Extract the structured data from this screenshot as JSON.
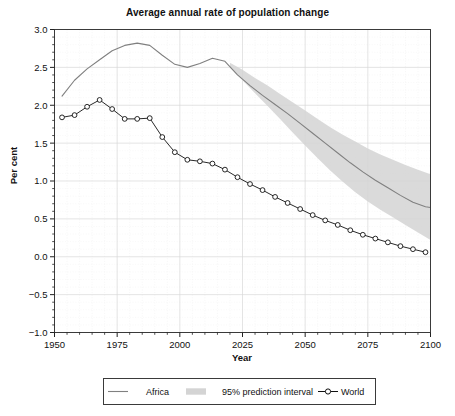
{
  "chart_data": {
    "type": "line",
    "title": "Average annual rate of population change",
    "xlabel": "Year",
    "ylabel": "Per cent",
    "xlim": [
      1950,
      2100
    ],
    "ylim": [
      -1.0,
      3.0
    ],
    "grid": true,
    "legend_position": "below",
    "xticks": [
      "1950",
      "1975",
      "2000",
      "2025",
      "2050",
      "2075",
      "2100"
    ],
    "xtick_values": [
      1950,
      1975,
      2000,
      2025,
      2050,
      2075,
      2100
    ],
    "yticks": [
      "3.0",
      "2.5",
      "2.0",
      "1.5",
      "1.0",
      "0.5",
      "0.0",
      "-0.5",
      "-1.0"
    ],
    "ytick_values": [
      3.0,
      2.5,
      2.0,
      1.5,
      1.0,
      0.5,
      0.0,
      -0.5,
      -1.0
    ],
    "series": [
      {
        "name": "Africa",
        "style": "line",
        "color": "#808080",
        "x": [
          1953,
          1958,
          1963,
          1968,
          1973,
          1978,
          1983,
          1988,
          1993,
          1998,
          2003,
          2008,
          2013,
          2018,
          2023,
          2028,
          2033,
          2038,
          2043,
          2048,
          2053,
          2058,
          2063,
          2068,
          2073,
          2078,
          2083,
          2088,
          2093,
          2098,
          2100
        ],
        "values": [
          2.12,
          2.33,
          2.48,
          2.6,
          2.72,
          2.79,
          2.82,
          2.79,
          2.66,
          2.54,
          2.5,
          2.55,
          2.62,
          2.58,
          2.4,
          2.26,
          2.13,
          2.01,
          1.89,
          1.76,
          1.63,
          1.5,
          1.37,
          1.24,
          1.12,
          1.01,
          0.91,
          0.81,
          0.72,
          0.66,
          0.65
        ]
      },
      {
        "name": "World",
        "style": "line-markers",
        "color": "#111111",
        "x": [
          1953,
          1958,
          1963,
          1968,
          1973,
          1978,
          1983,
          1988,
          1993,
          1998,
          2003,
          2008,
          2013,
          2018,
          2023,
          2028,
          2033,
          2038,
          2043,
          2048,
          2053,
          2058,
          2063,
          2068,
          2073,
          2078,
          2083,
          2088,
          2093,
          2098
        ],
        "values": [
          1.84,
          1.87,
          1.98,
          2.07,
          1.95,
          1.82,
          1.82,
          1.83,
          1.58,
          1.38,
          1.28,
          1.26,
          1.23,
          1.15,
          1.05,
          0.96,
          0.88,
          0.79,
          0.71,
          0.63,
          0.55,
          0.48,
          0.42,
          0.35,
          0.29,
          0.24,
          0.19,
          0.14,
          0.1,
          0.06
        ]
      }
    ],
    "band": {
      "name": "95% prediction interval",
      "color": "#d4d4d4",
      "x": [
        2020,
        2025,
        2030,
        2035,
        2040,
        2045,
        2050,
        2055,
        2060,
        2065,
        2070,
        2075,
        2080,
        2085,
        2090,
        2095,
        2100
      ],
      "lower": [
        2.5,
        2.33,
        2.16,
        1.99,
        1.82,
        1.64,
        1.47,
        1.3,
        1.14,
        0.99,
        0.85,
        0.73,
        0.62,
        0.52,
        0.42,
        0.32,
        0.22
      ],
      "upper": [
        2.56,
        2.47,
        2.36,
        2.26,
        2.15,
        2.04,
        1.93,
        1.82,
        1.71,
        1.61,
        1.52,
        1.43,
        1.35,
        1.28,
        1.21,
        1.15,
        1.09
      ]
    }
  },
  "legend": {
    "items": [
      {
        "label": "Africa",
        "marker": "line",
        "color": "#808080"
      },
      {
        "label": "95% prediction interval",
        "marker": "band",
        "color": "#d4d4d4"
      },
      {
        "label": "World",
        "marker": "line-circle",
        "color": "#111111"
      }
    ]
  }
}
